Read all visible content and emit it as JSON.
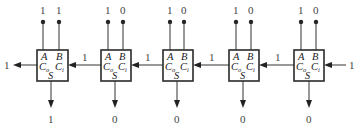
{
  "diagram": {
    "type": "ripple-carry adder chain",
    "pin_labels": {
      "a": "A",
      "b": "B",
      "cout": "C",
      "cout_sub": "o",
      "cin": "C",
      "cin_sub": "i",
      "sum": "S"
    },
    "adders": [
      {
        "id": "adder-1",
        "a": "1",
        "b": "1",
        "sum": "1",
        "carry_in": "1",
        "carry_out": "1"
      },
      {
        "id": "adder-2",
        "a": "1",
        "b": "0",
        "sum": "0",
        "carry_in": "1",
        "carry_out": "1"
      },
      {
        "id": "adder-3",
        "a": "1",
        "b": "0",
        "sum": "0",
        "carry_in": "1",
        "carry_out": "1"
      },
      {
        "id": "adder-4",
        "a": "1",
        "b": "0",
        "sum": "0",
        "carry_in": "1",
        "carry_out": "1"
      },
      {
        "id": "adder-5",
        "a": "1",
        "b": "0",
        "sum": "0",
        "carry_in": "1",
        "carry_out": "1"
      }
    ],
    "final_carry_out": "1",
    "initial_carry_in": "1",
    "carry_labels_between": [
      "1",
      "1",
      "1",
      "1"
    ]
  }
}
